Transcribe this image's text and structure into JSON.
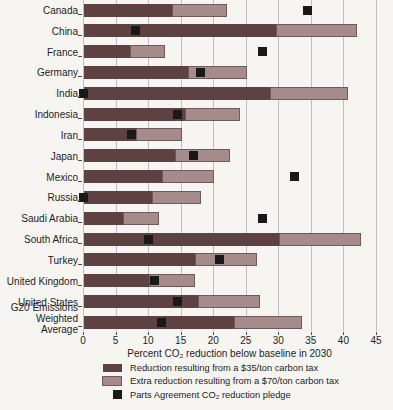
{
  "colors": {
    "background": "#f6f5f2",
    "grid": "#bfbfbf",
    "axis": "#4a4a4a",
    "text": "#1d1d1d",
    "tax35_bar": "#5e4143",
    "tax70_bar": "#a58b8b",
    "pledge_square": "#191919"
  },
  "chart_data": {
    "type": "bar",
    "orientation": "horizontal",
    "stacked": true,
    "title": "",
    "xlabel": "Percent CO₂ reduction below baseline in 2030",
    "ylabel": "",
    "xlim": [
      0,
      45
    ],
    "xticks": [
      0,
      5,
      10,
      15,
      20,
      25,
      30,
      35,
      40,
      45
    ],
    "grid": "vertical",
    "legend_position": "bottom",
    "categories": [
      "Canada",
      "China",
      "France",
      "Germany",
      "India",
      "Indonesia",
      "Iran",
      "Japan",
      "Mexico",
      "Russia",
      "Saudi Arabia",
      "South Africa",
      "Turkey",
      "United Kingdom",
      "United States",
      "G20 Emissions\nWeighted Average"
    ],
    "series": [
      {
        "name": "Reduction resulting from a $35/ton carbon tax",
        "type": "bar",
        "color": "#5e4143",
        "values": [
          13.5,
          29.5,
          7,
          16,
          28.5,
          15.5,
          8,
          14,
          12,
          10.5,
          6,
          30,
          17,
          10,
          17.5,
          23
        ]
      },
      {
        "name": "Extra reduction resulting from a $70/ton carbon tax",
        "type": "bar",
        "color": "#a58b8b",
        "values": [
          8.5,
          12.5,
          5.5,
          9,
          12,
          8.5,
          7,
          8.5,
          8,
          7.5,
          5.5,
          12.5,
          9.5,
          7,
          9.5,
          10.5
        ]
      },
      {
        "name": "Parts Agreement CO₂ reduction pledge",
        "type": "scatter-square",
        "color": "#191919",
        "values": [
          34.5,
          8,
          27.5,
          18,
          0,
          14.5,
          7.5,
          17,
          32.5,
          0,
          27.5,
          10,
          21,
          11,
          14.5,
          12
        ]
      }
    ]
  }
}
